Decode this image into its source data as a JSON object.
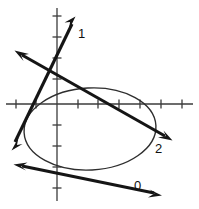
{
  "figure": {
    "background_color": "#ffffff",
    "width": 199,
    "height": 209,
    "axis_color": "#3b3b3b",
    "line_color": "#151515",
    "curve_color": "#2e2e2e"
  },
  "axes": {
    "origin": {
      "x": 57,
      "y": 104
    },
    "x_axis": {
      "x1": 6,
      "y1": 104,
      "x2": 193,
      "y2": 104
    },
    "y_axis": {
      "x1": 57,
      "y1": 8,
      "x2": 57,
      "y2": 201
    },
    "tick_length": 9,
    "x_ticks": [
      16,
      36,
      78,
      98,
      119,
      140,
      161,
      182
    ],
    "y_ticks": [
      16,
      37,
      58,
      79,
      125,
      146,
      167,
      188
    ],
    "tick_spacing_px": 20.7
  },
  "ellipse": {
    "name": "conic-ellipse",
    "center_x": 90,
    "center_y": 129,
    "radius_x": 66,
    "radius_y": 41,
    "rotation_deg": -3
  },
  "lines": [
    {
      "id": "line-1",
      "label": "1",
      "label_x": 78,
      "label_y": 38,
      "from": {
        "x": 13,
        "y": 147
      },
      "to": {
        "x": 75,
        "y": 19
      },
      "arrow_start": true,
      "arrow_end": true,
      "description": "steep positive-slope line with arrowheads at both ends"
    },
    {
      "id": "line-2",
      "label": "2",
      "label_x": 155,
      "label_y": 153,
      "from": {
        "x": 16,
        "y": 52
      },
      "to": {
        "x": 171,
        "y": 139
      },
      "arrow_start": true,
      "arrow_end": true,
      "description": "shallow negative-slope line crossing the ellipse"
    },
    {
      "id": "line-0",
      "label": "0",
      "label_x": 134,
      "label_y": 190,
      "from": {
        "x": 15,
        "y": 167
      },
      "to": {
        "x": 160,
        "y": 196
      },
      "arrow_start": true,
      "arrow_end": true,
      "description": "nearly horizontal line below the ellipse"
    }
  ]
}
